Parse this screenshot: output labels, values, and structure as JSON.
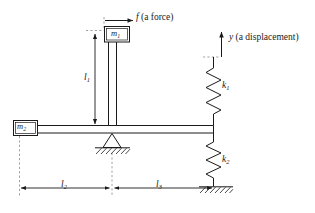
{
  "figure": {
    "type": "mechanical-lever-spring-mass-diagram",
    "background_color": "#ffffff",
    "line_color": "#1a1a1a",
    "dash_color": "#8a8a8a"
  },
  "labels": {
    "force": {
      "symbol": "f",
      "text": " (a force)",
      "full": "f (a force)"
    },
    "displacement": {
      "symbol": "y",
      "text": " (a displacement)",
      "full": "y (a displacement)"
    },
    "mass1": {
      "symbol": "m",
      "sub": "1"
    },
    "mass2": {
      "symbol": "m",
      "sub": "2"
    },
    "spring1": {
      "symbol": "k",
      "sub": "1"
    },
    "spring2": {
      "symbol": "k",
      "sub": "2"
    },
    "length1": {
      "symbol": "l",
      "sub": "1"
    },
    "length2": {
      "symbol": "l",
      "sub": "2"
    },
    "length3": {
      "symbol": "l",
      "sub": "3"
    }
  },
  "components": {
    "beam": "horizontal-rigid-beam",
    "rod": "vertical-rod",
    "fulcrum": "triangular-pivot-on-ground",
    "ground_top": "hatched-ground-under-fulcrum",
    "ground_bottom": "hatched-ground-under-spring-k2"
  }
}
